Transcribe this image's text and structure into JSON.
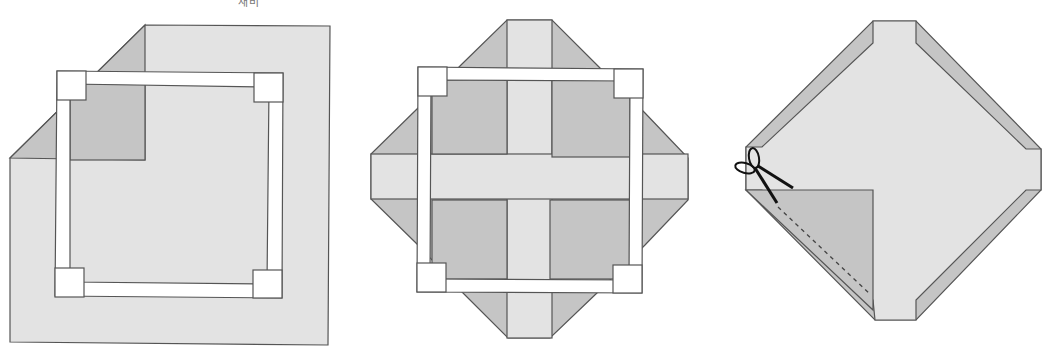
{
  "top_label": "새비",
  "colors": {
    "light": "#e3e3e3",
    "dark": "#c5c5c5",
    "outline": "#555555",
    "frame": "#ffffff"
  },
  "figures": [
    {
      "id": "step-1",
      "description": "Square sheet with top-left corner folded, frame overlay"
    },
    {
      "id": "step-2",
      "description": "Sheet folded into cross-shaped layout with corner triangles, frame overlay"
    },
    {
      "id": "step-3",
      "description": "Diamond-shaped folded sheet with scissors cutting along dashed line"
    }
  ]
}
